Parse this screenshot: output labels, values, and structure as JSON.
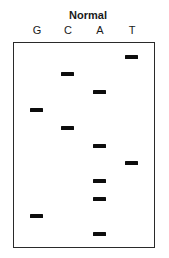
{
  "title": "Normal",
  "lanes": [
    {
      "label": "G",
      "x": 37
    },
    {
      "label": "C",
      "x": 68
    },
    {
      "label": "A",
      "x": 100
    },
    {
      "label": "T",
      "x": 132
    }
  ],
  "bands": [
    {
      "lane": "T",
      "y": 55
    },
    {
      "lane": "C",
      "y": 72
    },
    {
      "lane": "A",
      "y": 90
    },
    {
      "lane": "G",
      "y": 108
    },
    {
      "lane": "C",
      "y": 126
    },
    {
      "lane": "A",
      "y": 144
    },
    {
      "lane": "T",
      "y": 161
    },
    {
      "lane": "A",
      "y": 179
    },
    {
      "lane": "A",
      "y": 197
    },
    {
      "lane": "G",
      "y": 214
    },
    {
      "lane": "A",
      "y": 232
    }
  ],
  "read_sequence_bottom_to_top": "AGAATACGACT",
  "colors": {
    "band": "#0d0d0d",
    "border": "#2a2a2a",
    "background": "#ffffff"
  }
}
